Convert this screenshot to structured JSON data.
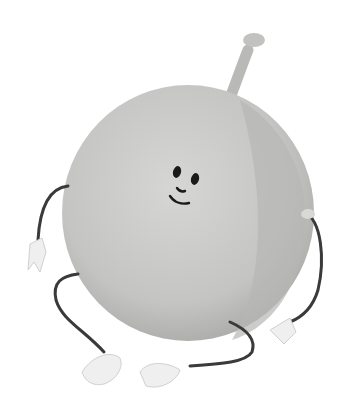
{
  "image": {
    "subject": "cartoon plum character",
    "colors": {
      "background": "#ffffff",
      "body": "#c8c8c6",
      "body_shadow": "#b0b0ae",
      "body_highlight": "#dcdcda",
      "stem": "#bdbdbb",
      "limbs": "#3a3a3a",
      "hands_feet": "#efefef",
      "face": "#1a1a1a"
    }
  }
}
